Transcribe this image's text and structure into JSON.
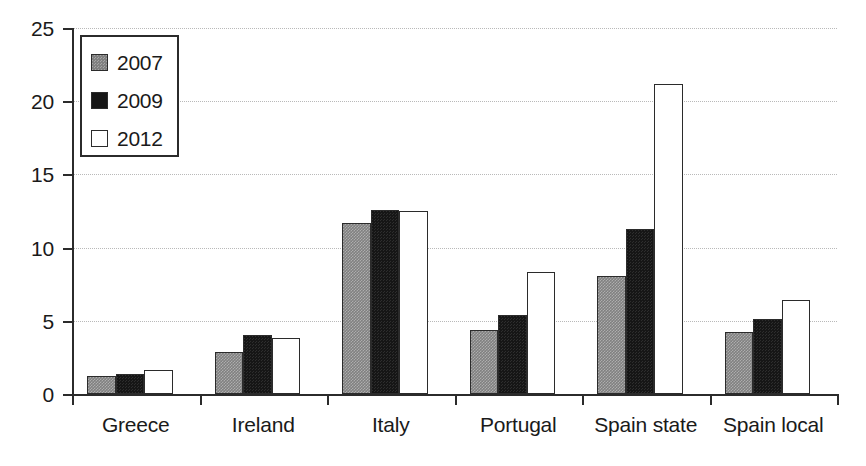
{
  "chart_data": {
    "type": "bar",
    "title": "",
    "subtitle": "",
    "xlabel": "",
    "ylabel": "",
    "ylim": [
      0,
      25
    ],
    "ytick_values": [
      0,
      5,
      10,
      15,
      20,
      25
    ],
    "ytick_labels": [
      "0",
      "5",
      "10",
      "15",
      "20",
      "25"
    ],
    "grid": true,
    "grid_style": "dotted-horizontal",
    "legend_position": "top-left",
    "categories": [
      "Greece",
      "Ireland",
      "Italy",
      "Portugal",
      "Spain state",
      "Spain local"
    ],
    "series": [
      {
        "name": "2007",
        "color": "#808080",
        "values": [
          1.2,
          2.9,
          11.7,
          4.4,
          8.05,
          4.25
        ]
      },
      {
        "name": "2009",
        "color": "#161616",
        "values": [
          1.4,
          4.0,
          12.6,
          5.4,
          11.3,
          5.1
        ]
      },
      {
        "name": "2012",
        "color": "#ffffff",
        "values": [
          1.65,
          3.8,
          12.5,
          8.35,
          21.2,
          6.4
        ]
      }
    ]
  },
  "legend": {
    "entries": [
      {
        "label": "2007"
      },
      {
        "label": "2009"
      },
      {
        "label": "2012"
      }
    ]
  },
  "axes": {
    "y": {
      "ticks": [
        "0",
        "5",
        "10",
        "15",
        "20",
        "25"
      ]
    },
    "x": {
      "ticks": [
        "Greece",
        "Ireland",
        "Italy",
        "Portugal",
        "Spain state",
        "Spain local"
      ]
    }
  },
  "colors": {
    "series_2007": "#808080",
    "series_2009": "#161616",
    "series_2012": "#ffffff",
    "axis": "#2b2b2b",
    "grid": "#b9b9b9",
    "text": "#1a1a1a",
    "background": "#ffffff"
  }
}
